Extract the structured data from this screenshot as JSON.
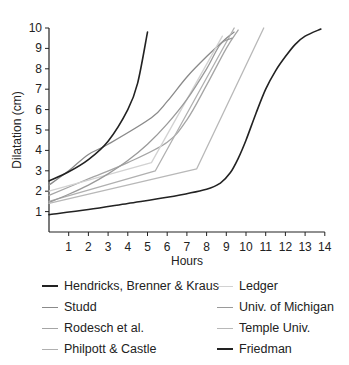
{
  "chart_data": {
    "type": "line",
    "title": "",
    "xlabel": "Hours",
    "ylabel": "Dilatation (cm)",
    "xlim": [
      0,
      14
    ],
    "ylim": [
      0,
      10
    ],
    "x_ticks": [
      1,
      2,
      3,
      4,
      5,
      6,
      7,
      8,
      9,
      10,
      11,
      12,
      13,
      14
    ],
    "y_ticks": [
      1,
      2,
      3,
      4,
      5,
      6,
      7,
      8,
      9,
      10
    ],
    "grid": false,
    "legend_position": "bottom",
    "series": [
      {
        "name": "Hendricks, Brenner & Kraus",
        "color": "#222222",
        "width": 1.6,
        "points": [
          [
            0,
            2.5
          ],
          [
            1,
            2.95
          ],
          [
            2,
            3.55
          ],
          [
            3,
            4.45
          ],
          [
            4,
            6.0
          ],
          [
            4.5,
            7.3
          ],
          [
            5,
            9.8
          ]
        ]
      },
      {
        "name": "Studd",
        "color": "#8a8a8a",
        "width": 1.3,
        "points": [
          [
            0,
            2.3
          ],
          [
            1,
            3.0
          ],
          [
            2,
            3.8
          ],
          [
            3,
            4.3
          ],
          [
            5.2,
            5.6
          ],
          [
            6,
            6.4
          ],
          [
            7,
            7.6
          ],
          [
            8,
            8.6
          ],
          [
            9,
            9.5
          ],
          [
            9.4,
            9.8
          ]
        ]
      },
      {
        "name": "Rodesch et al.",
        "color": "#a5a5a5",
        "width": 1.3,
        "points": [
          [
            0,
            1.8
          ],
          [
            2,
            2.6
          ],
          [
            4,
            3.4
          ],
          [
            6,
            4.4
          ],
          [
            7,
            5.5
          ],
          [
            8,
            7.2
          ],
          [
            9,
            9.0
          ],
          [
            9.6,
            9.9
          ]
        ]
      },
      {
        "name": "Philpott & Castle",
        "color": "#b0b0b0",
        "width": 1.3,
        "points": [
          [
            0,
            1.5
          ],
          [
            5.4,
            3.0
          ],
          [
            9.4,
            10.0
          ]
        ]
      },
      {
        "name": "Ledger",
        "color": "#d2d2d2",
        "width": 1.3,
        "points": [
          [
            0,
            2.0
          ],
          [
            5.2,
            3.4
          ],
          [
            8.8,
            9.6
          ]
        ]
      },
      {
        "name": "Univ. of Michigan",
        "color": "#9a9a9a",
        "width": 1.3,
        "points": [
          [
            0,
            1.45
          ],
          [
            1,
            1.85
          ],
          [
            2,
            2.3
          ],
          [
            3,
            2.85
          ],
          [
            4,
            3.5
          ],
          [
            5,
            4.3
          ],
          [
            6,
            5.3
          ],
          [
            7,
            6.5
          ],
          [
            8,
            8.0
          ],
          [
            8.7,
            9.2
          ],
          [
            9.3,
            9.5
          ]
        ]
      },
      {
        "name": "Temple Univ.",
        "color": "#b8b8b8",
        "width": 1.3,
        "points": [
          [
            0,
            1.4
          ],
          [
            7.5,
            3.1
          ],
          [
            10.9,
            10.0
          ]
        ]
      },
      {
        "name": "Friedman",
        "color": "#222222",
        "width": 1.6,
        "points": [
          [
            0,
            0.85
          ],
          [
            2,
            1.1
          ],
          [
            4,
            1.4
          ],
          [
            6,
            1.7
          ],
          [
            8,
            2.1
          ],
          [
            8.7,
            2.4
          ],
          [
            9.2,
            2.9
          ],
          [
            9.6,
            3.6
          ],
          [
            10,
            4.5
          ],
          [
            10.5,
            5.8
          ],
          [
            11,
            7.0
          ],
          [
            11.5,
            7.9
          ],
          [
            12,
            8.6
          ],
          [
            12.5,
            9.2
          ],
          [
            13,
            9.6
          ],
          [
            13.8,
            9.95
          ]
        ]
      }
    ]
  },
  "axes": {
    "ylabel": "Dilatation (cm)",
    "xlabel": "Hours"
  },
  "legend": {
    "items": [
      {
        "label": "Hendricks, Brenner & Kraus",
        "color": "#222222"
      },
      {
        "label": "Studd",
        "color": "#8a8a8a"
      },
      {
        "label": "Rodesch et al.",
        "color": "#a5a5a5"
      },
      {
        "label": "Philpott & Castle",
        "color": "#b0b0b0"
      },
      {
        "label": "Ledger",
        "color": "#d2d2d2"
      },
      {
        "label": "Univ. of Michigan",
        "color": "#9a9a9a"
      },
      {
        "label": "Temple Univ.",
        "color": "#b8b8b8"
      },
      {
        "label": "Friedman",
        "color": "#222222"
      }
    ]
  }
}
